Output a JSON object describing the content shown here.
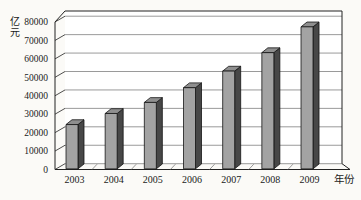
{
  "chart_data": {
    "type": "bar",
    "style": "3d-column",
    "title": "",
    "ylabel": "亿元",
    "xlabel": "年份",
    "categories": [
      "2003",
      "2004",
      "2005",
      "2006",
      "2007",
      "2008",
      "2009"
    ],
    "values": [
      24000,
      30000,
      36000,
      44000,
      53000,
      63000,
      77000
    ],
    "ylim": [
      0,
      80000
    ],
    "ytick_step": 10000,
    "yticks": [
      0,
      10000,
      20000,
      30000,
      40000,
      50000,
      60000,
      70000,
      80000
    ],
    "ytick_labels": [
      "0",
      "10000",
      "20000",
      "30000",
      "40000",
      "50000",
      "60000",
      "70000",
      "80000"
    ],
    "grid": "horizontal",
    "legend": "none",
    "colors": {
      "bar_front": "#a3a3a3",
      "bar_top": "#8f8f8f",
      "bar_side": "#474747",
      "bar_outline": "#141414",
      "gridline": "#6f6f6f",
      "axis": "#222222",
      "background": "#fbfaf7",
      "wall": "#ffffff"
    }
  }
}
